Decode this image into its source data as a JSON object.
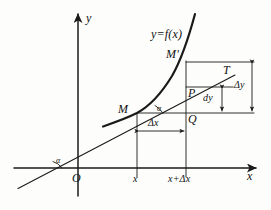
{
  "figure": {
    "kind": "calculus-differential-diagram",
    "background_color": "#fdfdfb",
    "ink_color": "#1a1a1a"
  },
  "axes": {
    "x_label": "x",
    "y_label": "y",
    "origin_label": "O"
  },
  "labels": {
    "function": "y=f(x)",
    "point_m": "M",
    "point_m_prime": "M'",
    "point_p": "P",
    "point_q": "Q",
    "point_t": "T",
    "angle_origin": "α",
    "angle_at_m": "α",
    "delta_x": "Δx",
    "delta_y": "Δy",
    "dy": "dy",
    "tick_x": "x",
    "tick_x_plus_dx": "x+Δx"
  },
  "geometry": {
    "origin": [
      78,
      168
    ],
    "x_axis_end": [
      258,
      168
    ],
    "y_axis_top": [
      78,
      12
    ],
    "point_m": [
      137,
      113
    ],
    "point_m_prime": [
      186,
      62
    ],
    "point_p": [
      186,
      87
    ],
    "point_q": [
      186,
      113
    ],
    "tick_x": 137,
    "tick_x_plus_dx": 186,
    "delta_x_bar_y": 131,
    "delta_y_bar_x": 252,
    "dy_bar_x": 222,
    "tangent_from": [
      18,
      188
    ],
    "tangent_to": [
      233,
      76
    ]
  }
}
